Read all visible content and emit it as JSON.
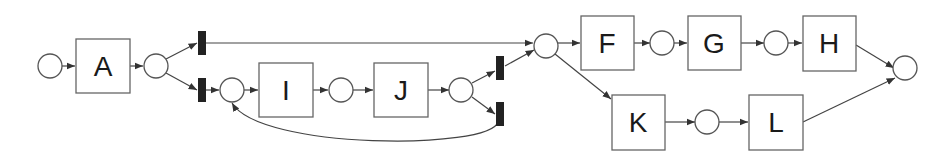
{
  "diagram": {
    "type": "petri-net",
    "colors": {
      "stroke": "#555555",
      "silent_transition": "#222222",
      "label": "#1a1a1a",
      "background": "#ffffff"
    },
    "places": [
      {
        "id": "p_start"
      },
      {
        "id": "p_after_A"
      },
      {
        "id": "p_loop_entry"
      },
      {
        "id": "p_I_J"
      },
      {
        "id": "p_after_J"
      },
      {
        "id": "p_merge"
      },
      {
        "id": "p_F_G"
      },
      {
        "id": "p_G_H"
      },
      {
        "id": "p_K_L"
      },
      {
        "id": "p_end"
      }
    ],
    "tasks": [
      {
        "id": "A",
        "label": "A"
      },
      {
        "id": "I",
        "label": "I"
      },
      {
        "id": "J",
        "label": "J"
      },
      {
        "id": "F",
        "label": "F"
      },
      {
        "id": "G",
        "label": "G"
      },
      {
        "id": "H",
        "label": "H"
      },
      {
        "id": "K",
        "label": "K"
      },
      {
        "id": "L",
        "label": "L"
      }
    ],
    "silent_transitions": [
      {
        "id": "tau_skip"
      },
      {
        "id": "tau_enter_loop"
      },
      {
        "id": "tau_exit_loop"
      },
      {
        "id": "tau_redo"
      }
    ],
    "arcs": [
      [
        "p_start",
        "A"
      ],
      [
        "A",
        "p_after_A"
      ],
      [
        "p_after_A",
        "tau_skip"
      ],
      [
        "p_after_A",
        "tau_enter_loop"
      ],
      [
        "tau_skip",
        "p_merge"
      ],
      [
        "tau_enter_loop",
        "p_loop_entry"
      ],
      [
        "p_loop_entry",
        "I"
      ],
      [
        "I",
        "p_I_J"
      ],
      [
        "p_I_J",
        "J"
      ],
      [
        "J",
        "p_after_J"
      ],
      [
        "p_after_J",
        "tau_exit_loop"
      ],
      [
        "p_after_J",
        "tau_redo"
      ],
      [
        "tau_exit_loop",
        "p_merge"
      ],
      [
        "tau_redo",
        "p_loop_entry"
      ],
      [
        "p_merge",
        "F"
      ],
      [
        "p_merge",
        "K"
      ],
      [
        "F",
        "p_F_G"
      ],
      [
        "p_F_G",
        "G"
      ],
      [
        "G",
        "p_G_H"
      ],
      [
        "p_G_H",
        "H"
      ],
      [
        "H",
        "p_end"
      ],
      [
        "K",
        "p_K_L"
      ],
      [
        "p_K_L",
        "L"
      ],
      [
        "L",
        "p_end"
      ]
    ]
  }
}
